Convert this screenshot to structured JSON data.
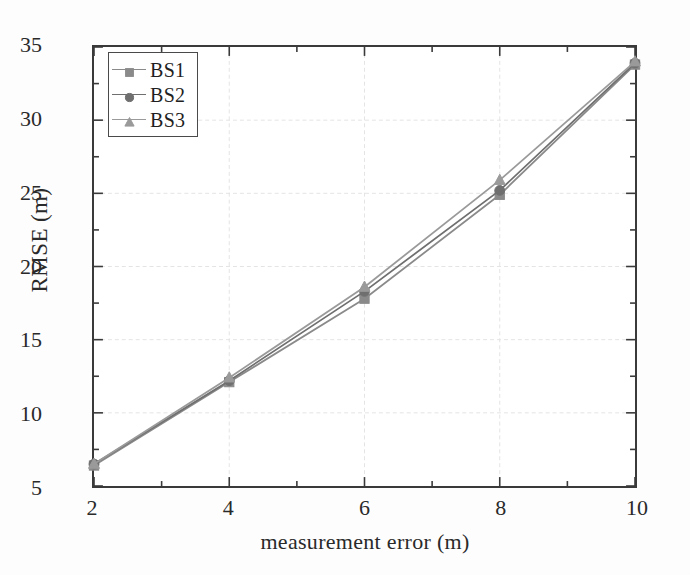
{
  "chart_data": {
    "type": "line",
    "title": "",
    "xlabel": "measurement error (m)",
    "ylabel": "RMSE (m)",
    "x": [
      2,
      4,
      6,
      8,
      10
    ],
    "xlim": [
      2,
      10
    ],
    "ylim": [
      5,
      35
    ],
    "xticks": [
      2,
      4,
      6,
      8,
      10
    ],
    "yticks": [
      5,
      10,
      15,
      20,
      25,
      30,
      35
    ],
    "xtick_labels": [
      "2",
      "4",
      "6",
      "8",
      "10"
    ],
    "ytick_labels": [
      "5",
      "10",
      "15",
      "20",
      "25",
      "30",
      "35"
    ],
    "x_minor_step": 1,
    "y_minor_step": 2.5,
    "grid": true,
    "grid_color": "#e4e4e4",
    "legend_position": "upper-left",
    "series": [
      {
        "name": "BS1",
        "marker": "square",
        "color": "#8a8a8a",
        "values": [
          6.4,
          12.1,
          17.8,
          24.9,
          33.8
        ]
      },
      {
        "name": "BS2",
        "marker": "circle",
        "color": "#6f6f6f",
        "values": [
          6.5,
          12.2,
          18.3,
          25.2,
          33.9
        ]
      },
      {
        "name": "BS3",
        "marker": "triangle",
        "color": "#9a9a9a",
        "values": [
          6.5,
          12.4,
          18.6,
          25.9,
          34.0
        ]
      }
    ]
  },
  "legend": {
    "items": [
      {
        "label": "BS1"
      },
      {
        "label": "BS2"
      },
      {
        "label": "BS3"
      }
    ]
  }
}
